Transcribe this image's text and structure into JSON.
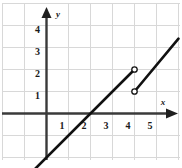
{
  "chart_data": {
    "type": "line",
    "title": "",
    "xlabel": "x",
    "ylabel": "y",
    "grid": true,
    "legend": false,
    "xlim": [
      -2.1,
      6.2
    ],
    "ylim": [
      -2.1,
      5.2
    ],
    "xticks": [
      1,
      2,
      3,
      4,
      5
    ],
    "yticks": [
      1,
      2,
      3,
      4
    ],
    "xtick_labels": [
      "1",
      "2",
      "3",
      "4",
      "5"
    ],
    "ytick_labels": [
      "1",
      "2",
      "3",
      "4"
    ],
    "series": [
      {
        "name": "segment-1",
        "equation": "y = x - 2",
        "x": [
          -0.5,
          4
        ],
        "y": [
          -2.5,
          2
        ],
        "left_endpoint": "none",
        "right_endpoint": "open"
      },
      {
        "name": "segment-2",
        "equation": "y = x - 3",
        "x": [
          4,
          6
        ],
        "y": [
          1,
          3.4
        ],
        "left_endpoint": "open",
        "right_endpoint": "none"
      }
    ],
    "open_points": [
      {
        "x": 4,
        "y": 2
      },
      {
        "x": 4,
        "y": 1
      }
    ],
    "x_intercept": 2,
    "colors": {
      "curve": "#111111",
      "axis": "#3a3a3a",
      "grid": "#d6d6d6",
      "label": "#1a1a1a",
      "background": "#ffffff"
    }
  },
  "axes": {
    "x_axis_label": "x",
    "y_axis_label": "y"
  }
}
